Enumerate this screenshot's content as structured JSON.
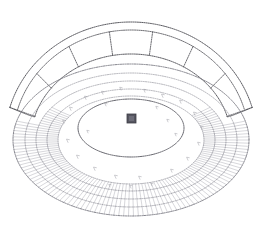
{
  "document": {
    "title": "Amphitheater Site Plan",
    "medium": "line-drawing",
    "background_color": "#ffffff",
    "ink_color": "#4a4a50",
    "faint_ink_color": "#9a9aa2",
    "canvas": {
      "width": 260,
      "height": 236
    }
  },
  "drawing": {
    "kind": "architectural-perspective-line-drawing",
    "subject": "elliptical amphitheater with segmented canopy roof",
    "elements": [
      {
        "name": "outer-bowl-ellipse",
        "role": "outermost seating boundary",
        "stroke": "#6f6f78",
        "style": "dotted"
      },
      {
        "name": "seating-tier-rings",
        "role": "concentric seating tiers with radial hatching",
        "stroke": "#8d8d96",
        "style": "dotted",
        "ring_count": 4
      },
      {
        "name": "arena-floor-ellipse",
        "role": "central arena floor",
        "stroke": "#55555e",
        "style": "dotted"
      },
      {
        "name": "center-marker",
        "role": "central square marker",
        "fill": "#555560",
        "size_px": 9
      },
      {
        "name": "canopy-roof",
        "role": "arched segmented canopy above rear seating",
        "stroke": "#5a5a63",
        "style": "dotted",
        "panel_count": 7
      },
      {
        "name": "canopy-end-cap-left",
        "role": "rounded terminus of canopy",
        "stroke": "#5a5a63",
        "style": "dotted"
      },
      {
        "name": "canopy-end-cap-right",
        "role": "rounded terminus of canopy",
        "stroke": "#5a5a63",
        "style": "dotted"
      },
      {
        "name": "scatter-figures",
        "role": "faint scale figures / vegetation marks",
        "stroke": "#b6b6be",
        "count": 26
      }
    ]
  },
  "geometry": {
    "bowl": {
      "center_x": 131,
      "center_y": 140,
      "rings": [
        {
          "rx": 118,
          "ry": 76,
          "label": "outer-perimeter"
        },
        {
          "rx": 106,
          "ry": 67,
          "label": "tier-4-outer"
        },
        {
          "rx": 95,
          "ry": 59,
          "label": "tier-3"
        },
        {
          "rx": 84,
          "ry": 51,
          "label": "tier-2"
        },
        {
          "rx": 73,
          "ry": 44,
          "label": "tier-1-inner"
        }
      ],
      "arena": {
        "cx": 131,
        "cy": 128,
        "rx": 53,
        "ry": 29
      }
    },
    "canopy": {
      "outer_arc": {
        "cx": 131,
        "cy": 140,
        "rx": 126,
        "ry": 118
      },
      "inner_arc": {
        "cx": 131,
        "cy": 140,
        "rx": 100,
        "ry": 86
      },
      "band_arc": {
        "cx": 131,
        "cy": 140,
        "rx": 118,
        "ry": 110
      },
      "start_angle_deg": 196,
      "end_angle_deg": 344,
      "divider_count": 6
    },
    "center_marker": {
      "x": 127,
      "y": 114,
      "w": 9,
      "h": 9
    }
  },
  "scatter_points": [
    {
      "x": 86,
      "y": 97,
      "r": 1.5
    },
    {
      "x": 103,
      "y": 92,
      "r": 1.4
    },
    {
      "x": 121,
      "y": 88,
      "r": 1.3
    },
    {
      "x": 145,
      "y": 90,
      "r": 1.4
    },
    {
      "x": 163,
      "y": 95,
      "r": 1.5
    },
    {
      "x": 181,
      "y": 101,
      "r": 1.4
    },
    {
      "x": 71,
      "y": 108,
      "r": 1.5
    },
    {
      "x": 64,
      "y": 121,
      "r": 1.4
    },
    {
      "x": 195,
      "y": 113,
      "r": 1.5
    },
    {
      "x": 202,
      "y": 127,
      "r": 1.4
    },
    {
      "x": 68,
      "y": 140,
      "r": 1.5
    },
    {
      "x": 199,
      "y": 143,
      "r": 1.4
    },
    {
      "x": 78,
      "y": 156,
      "r": 1.5
    },
    {
      "x": 188,
      "y": 158,
      "r": 1.4
    },
    {
      "x": 95,
      "y": 168,
      "r": 1.5
    },
    {
      "x": 172,
      "y": 170,
      "r": 1.4
    },
    {
      "x": 116,
      "y": 176,
      "r": 1.5
    },
    {
      "x": 140,
      "y": 177,
      "r": 1.4
    },
    {
      "x": 106,
      "y": 104,
      "r": 1.2
    },
    {
      "x": 157,
      "y": 107,
      "r": 1.2
    },
    {
      "x": 88,
      "y": 131,
      "r": 1.2
    },
    {
      "x": 176,
      "y": 134,
      "r": 1.2
    },
    {
      "x": 131,
      "y": 186,
      "r": 1.3
    },
    {
      "x": 152,
      "y": 184,
      "r": 1.2
    },
    {
      "x": 110,
      "y": 185,
      "r": 1.2
    },
    {
      "x": 168,
      "y": 120,
      "r": 1.2
    }
  ]
}
